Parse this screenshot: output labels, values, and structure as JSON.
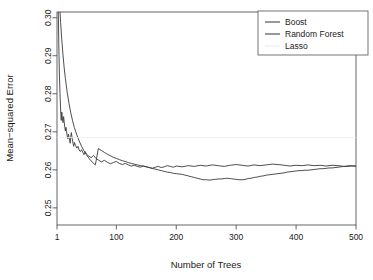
{
  "chart_data": {
    "type": "line",
    "title": "",
    "xlabel": "Number of Trees",
    "ylabel": "Mean−squared Error",
    "xlim": [
      1,
      500
    ],
    "ylim": [
      0.2455,
      0.3015
    ],
    "grid": false,
    "legend_position": "top-right",
    "xticks": [
      1,
      100,
      200,
      300,
      400,
      500
    ],
    "xtick_labels": [
      "1",
      "100",
      "200",
      "300",
      "400",
      "500"
    ],
    "yticks": [
      0.25,
      0.26,
      0.27,
      0.28,
      0.29,
      0.3
    ],
    "ytick_labels": [
      "0.25",
      "0.26",
      "0.27",
      "0.28",
      "0.29",
      "0.30"
    ],
    "legend": [
      {
        "name": "Boost",
        "color": "#333333",
        "swatch": true
      },
      {
        "name": "Random Forest",
        "color": "#333333",
        "swatch": true
      },
      {
        "name": "Lasso",
        "color": "#e8e8ec",
        "swatch": false
      }
    ],
    "series": [
      {
        "name": "Boost",
        "color": "#3a3a3a",
        "width": 0.9,
        "x": [
          1,
          3,
          5,
          7,
          9,
          11,
          13,
          15,
          18,
          21,
          24,
          27,
          30,
          34,
          38,
          42,
          46,
          50,
          55,
          60,
          65,
          70,
          75,
          80,
          85,
          90,
          95,
          100,
          105,
          110,
          115,
          120,
          125,
          130,
          135,
          140,
          145,
          150,
          155,
          160,
          165,
          170,
          175,
          180,
          185,
          190,
          195,
          200,
          205,
          210,
          215,
          220,
          225,
          230,
          235,
          240,
          245,
          250,
          255,
          260,
          265,
          270,
          275,
          280,
          285,
          290,
          295,
          300,
          305,
          310,
          315,
          320,
          325,
          330,
          335,
          340,
          345,
          350,
          355,
          360,
          365,
          370,
          375,
          380,
          385,
          390,
          395,
          400,
          405,
          410,
          415,
          420,
          425,
          430,
          435,
          440,
          445,
          450,
          455,
          460,
          465,
          470,
          475,
          480,
          485,
          490,
          495,
          500
        ],
        "y": [
          0.318,
          0.311,
          0.3045,
          0.2988,
          0.2942,
          0.2902,
          0.2868,
          0.284,
          0.2804,
          0.2775,
          0.275,
          0.2729,
          0.2711,
          0.2692,
          0.2676,
          0.2662,
          0.265,
          0.264,
          0.2629,
          0.262,
          0.2613,
          0.2656,
          0.2651,
          0.2646,
          0.2641,
          0.2637,
          0.2633,
          0.263,
          0.2627,
          0.2624,
          0.2622,
          0.2619,
          0.2617,
          0.2615,
          0.2613,
          0.2611,
          0.261,
          0.2608,
          0.2606,
          0.2604,
          0.2602,
          0.26,
          0.2598,
          0.2596,
          0.2594,
          0.2593,
          0.2591,
          0.259,
          0.2589,
          0.2588,
          0.2586,
          0.2584,
          0.2582,
          0.258,
          0.2578,
          0.2576,
          0.2574,
          0.2574,
          0.2573,
          0.2574,
          0.2575,
          0.2576,
          0.2576,
          0.2577,
          0.2578,
          0.2577,
          0.2576,
          0.2575,
          0.2574,
          0.2574,
          0.2575,
          0.2577,
          0.2578,
          0.258,
          0.2581,
          0.2583,
          0.2584,
          0.2586,
          0.2587,
          0.2588,
          0.2589,
          0.259,
          0.2591,
          0.2592,
          0.2594,
          0.2595,
          0.2596,
          0.2597,
          0.2598,
          0.2598,
          0.2599,
          0.2599,
          0.26,
          0.2601,
          0.2602,
          0.2603,
          0.2603,
          0.2604,
          0.2605,
          0.2605,
          0.2606,
          0.2607,
          0.2608,
          0.2609,
          0.2609,
          0.261,
          0.261,
          0.261
        ]
      },
      {
        "name": "Random Forest",
        "color": "#3a3a3a",
        "width": 0.9,
        "x": [
          1,
          2,
          3,
          4,
          5,
          6,
          7,
          8,
          9,
          10,
          11,
          12,
          13,
          14,
          15,
          16,
          17,
          18,
          19,
          20,
          21,
          22,
          23,
          24,
          25,
          26,
          27,
          28,
          29,
          30,
          32,
          34,
          36,
          38,
          40,
          42,
          44,
          46,
          48,
          50,
          54,
          58,
          62,
          66,
          70,
          75,
          80,
          85,
          90,
          95,
          100,
          105,
          110,
          115,
          120,
          125,
          130,
          135,
          140,
          145,
          150,
          155,
          160,
          165,
          170,
          175,
          180,
          185,
          190,
          195,
          200,
          210,
          220,
          230,
          240,
          250,
          260,
          270,
          280,
          290,
          300,
          310,
          320,
          330,
          340,
          350,
          360,
          370,
          380,
          390,
          400,
          410,
          420,
          430,
          440,
          450,
          460,
          470,
          480,
          490,
          500
        ],
        "y": [
          0.334,
          0.318,
          0.303,
          0.293,
          0.2852,
          0.28,
          0.276,
          0.273,
          0.2752,
          0.2736,
          0.2724,
          0.274,
          0.2726,
          0.2712,
          0.2702,
          0.2712,
          0.27,
          0.269,
          0.2682,
          0.2694,
          0.2686,
          0.2678,
          0.267,
          0.2688,
          0.2698,
          0.2686,
          0.2676,
          0.2668,
          0.2662,
          0.2672,
          0.2664,
          0.2657,
          0.2662,
          0.2652,
          0.2648,
          0.2653,
          0.2646,
          0.264,
          0.2648,
          0.2642,
          0.2636,
          0.2632,
          0.2638,
          0.263,
          0.2626,
          0.2621,
          0.2625,
          0.262,
          0.2616,
          0.2619,
          0.2622,
          0.2617,
          0.2614,
          0.2617,
          0.2613,
          0.261,
          0.2612,
          0.2609,
          0.2607,
          0.261,
          0.2608,
          0.2606,
          0.2604,
          0.2607,
          0.2609,
          0.2606,
          0.2608,
          0.2611,
          0.2609,
          0.2607,
          0.261,
          0.2608,
          0.2611,
          0.2609,
          0.2612,
          0.261,
          0.2613,
          0.2611,
          0.2609,
          0.2612,
          0.2614,
          0.2612,
          0.261,
          0.2613,
          0.2611,
          0.2613,
          0.2615,
          0.2614,
          0.2612,
          0.261,
          0.2612,
          0.2611,
          0.2613,
          0.2611,
          0.2612,
          0.261,
          0.2612,
          0.2611,
          0.2609,
          0.2611,
          0.261
        ]
      },
      {
        "name": "Lasso",
        "color": "#ececf0",
        "width": 0.8,
        "constant": 0.2685,
        "x": [
          1,
          500
        ],
        "y": [
          0.2685,
          0.2685
        ]
      }
    ]
  },
  "legend_box": {
    "items": [
      "Boost",
      "Random Forest",
      "Lasso"
    ]
  }
}
